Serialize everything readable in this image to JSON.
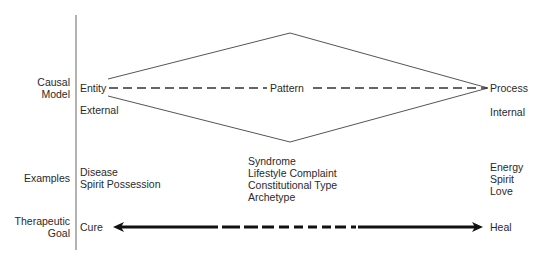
{
  "row_labels": {
    "causal_model": [
      "Causal",
      "Model"
    ],
    "examples": "Examples",
    "therapeutic_goal": [
      "Therapeutic",
      "Goal"
    ]
  },
  "causal_model": {
    "left_node": "Entity",
    "center_node": "Pattern",
    "right_node": "Process",
    "left_sublabel": "External",
    "right_sublabel": "Internal"
  },
  "examples": {
    "left": [
      "Disease",
      "Spirit Possession"
    ],
    "center": [
      "Syndrome",
      "Lifestyle Complaint",
      "Constitutional Type",
      "Archetype"
    ],
    "right": [
      "Energy",
      "Spirit",
      "Love"
    ]
  },
  "therapeutic_goal": {
    "left": "Cure",
    "right": "Heal"
  },
  "colors": {
    "line": "#555555",
    "arrow": "#111111",
    "text": "#2a2a2a"
  }
}
